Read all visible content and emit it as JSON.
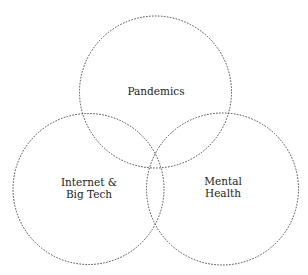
{
  "diagram": {
    "type": "venn",
    "sets": [
      {
        "id": "pandemics",
        "lines": [
          "Pandemics"
        ]
      },
      {
        "id": "internet",
        "lines": [
          "Internet &",
          "Big Tech"
        ]
      },
      {
        "id": "mental",
        "lines": [
          "Mental",
          "Health"
        ]
      }
    ],
    "stroke_color": "#4a4a4a",
    "text_color": "#222222"
  }
}
